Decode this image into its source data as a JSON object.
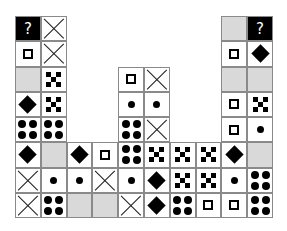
{
  "puzzle": {
    "columns": 10,
    "rows": 8,
    "question_label": "?",
    "colors": {
      "gray": "#d9d9d9",
      "black": "#000000",
      "border": "#8a8a8a"
    },
    "cells": [
      {
        "r": 0,
        "c": 0,
        "t": "q"
      },
      {
        "r": 0,
        "c": 1,
        "t": "x"
      },
      {
        "r": 0,
        "c": 8,
        "t": "gray"
      },
      {
        "r": 0,
        "c": 9,
        "t": "q"
      },
      {
        "r": 1,
        "c": 0,
        "t": "square"
      },
      {
        "r": 1,
        "c": 1,
        "t": "x"
      },
      {
        "r": 1,
        "c": 8,
        "t": "square"
      },
      {
        "r": 1,
        "c": 9,
        "t": "diamond"
      },
      {
        "r": 2,
        "c": 0,
        "t": "gray"
      },
      {
        "r": 2,
        "c": 1,
        "t": "five"
      },
      {
        "r": 2,
        "c": 4,
        "t": "square"
      },
      {
        "r": 2,
        "c": 5,
        "t": "x"
      },
      {
        "r": 2,
        "c": 8,
        "t": "gray"
      },
      {
        "r": 2,
        "c": 9,
        "t": "gray"
      },
      {
        "r": 3,
        "c": 0,
        "t": "diamond"
      },
      {
        "r": 3,
        "c": 1,
        "t": "five"
      },
      {
        "r": 3,
        "c": 4,
        "t": "dot"
      },
      {
        "r": 3,
        "c": 5,
        "t": "dot"
      },
      {
        "r": 3,
        "c": 8,
        "t": "square"
      },
      {
        "r": 3,
        "c": 9,
        "t": "five"
      },
      {
        "r": 4,
        "c": 0,
        "t": "four"
      },
      {
        "r": 4,
        "c": 1,
        "t": "four"
      },
      {
        "r": 4,
        "c": 4,
        "t": "four"
      },
      {
        "r": 4,
        "c": 5,
        "t": "x"
      },
      {
        "r": 4,
        "c": 8,
        "t": "square"
      },
      {
        "r": 4,
        "c": 9,
        "t": "dot"
      },
      {
        "r": 5,
        "c": 0,
        "t": "diamond"
      },
      {
        "r": 5,
        "c": 1,
        "t": "gray"
      },
      {
        "r": 5,
        "c": 2,
        "t": "diamond"
      },
      {
        "r": 5,
        "c": 3,
        "t": "square"
      },
      {
        "r": 5,
        "c": 4,
        "t": "four"
      },
      {
        "r": 5,
        "c": 5,
        "t": "five"
      },
      {
        "r": 5,
        "c": 6,
        "t": "five"
      },
      {
        "r": 5,
        "c": 7,
        "t": "five"
      },
      {
        "r": 5,
        "c": 8,
        "t": "diamond"
      },
      {
        "r": 5,
        "c": 9,
        "t": "gray"
      },
      {
        "r": 6,
        "c": 0,
        "t": "x"
      },
      {
        "r": 6,
        "c": 1,
        "t": "dot"
      },
      {
        "r": 6,
        "c": 2,
        "t": "dot"
      },
      {
        "r": 6,
        "c": 3,
        "t": "x"
      },
      {
        "r": 6,
        "c": 4,
        "t": "dot"
      },
      {
        "r": 6,
        "c": 5,
        "t": "diamond"
      },
      {
        "r": 6,
        "c": 6,
        "t": "five"
      },
      {
        "r": 6,
        "c": 7,
        "t": "five"
      },
      {
        "r": 6,
        "c": 8,
        "t": "dot"
      },
      {
        "r": 6,
        "c": 9,
        "t": "four"
      },
      {
        "r": 7,
        "c": 0,
        "t": "x"
      },
      {
        "r": 7,
        "c": 1,
        "t": "four"
      },
      {
        "r": 7,
        "c": 2,
        "t": "gray"
      },
      {
        "r": 7,
        "c": 3,
        "t": "gray"
      },
      {
        "r": 7,
        "c": 4,
        "t": "x"
      },
      {
        "r": 7,
        "c": 5,
        "t": "diamond"
      },
      {
        "r": 7,
        "c": 6,
        "t": "four"
      },
      {
        "r": 7,
        "c": 7,
        "t": "square"
      },
      {
        "r": 7,
        "c": 8,
        "t": "square"
      },
      {
        "r": 7,
        "c": 9,
        "t": "four"
      }
    ]
  }
}
